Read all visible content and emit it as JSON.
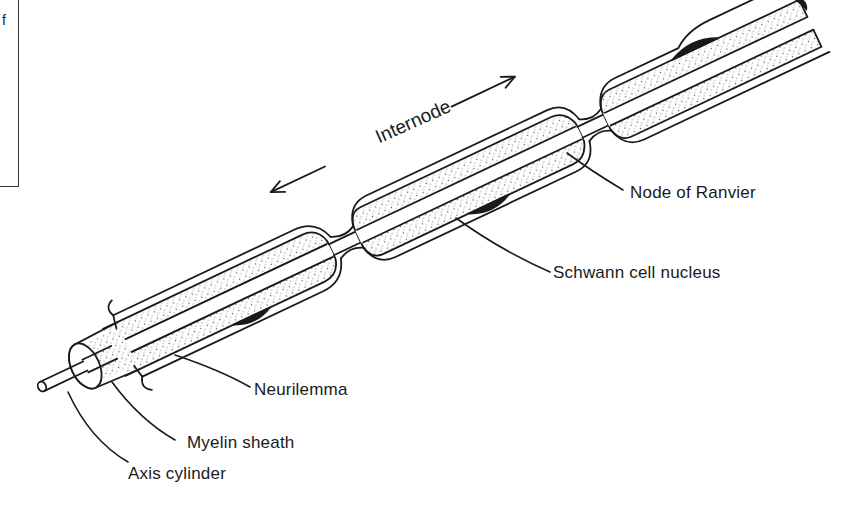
{
  "figure": {
    "fragment_text": "f",
    "labels": {
      "internode": "Internode",
      "node_of_ranvier": "Node of Ranvier",
      "schwann_cell_nucleus": "Schwann cell nucleus",
      "neurilemma": "Neurilemma",
      "myelin_sheath": "Myelin sheath",
      "axis_cylinder": "Axis cylinder"
    },
    "colors": {
      "ink": "#1a1a1a",
      "background": "#ffffff",
      "stipple": "#555555"
    }
  }
}
